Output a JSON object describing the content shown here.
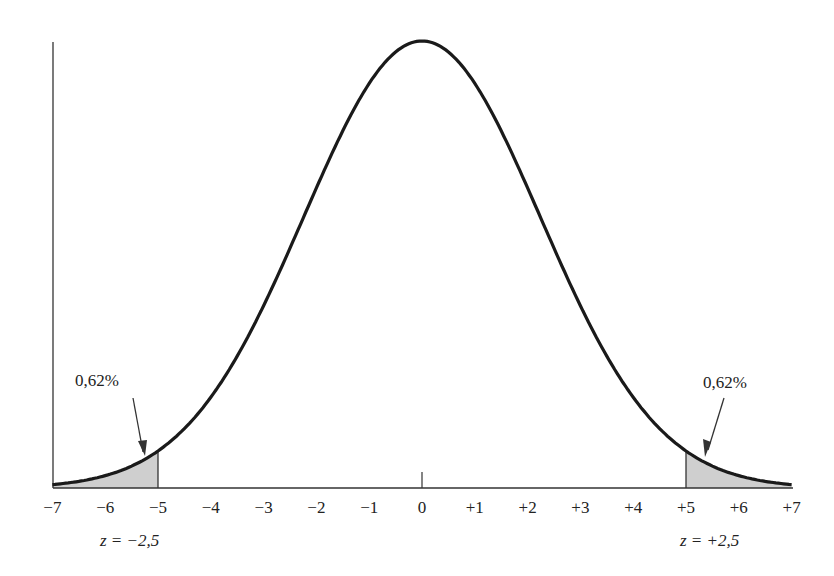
{
  "chart_data": {
    "type": "area",
    "title": "",
    "xlabel": "",
    "ylabel": "",
    "x_ticks": [
      "−7",
      "−6",
      "−5",
      "−4",
      "−3",
      "−2",
      "−1",
      "0",
      "+1",
      "+2",
      "+3",
      "+4",
      "+5",
      "+6",
      "+7"
    ],
    "x_values": [
      -7,
      -6,
      -5,
      -4,
      -3,
      -2,
      -1,
      0,
      1,
      2,
      3,
      4,
      5,
      6,
      7
    ],
    "xlim": [
      -7,
      7
    ],
    "grid": false,
    "legend": null,
    "curve": "normal distribution (bell curve) centered at 0",
    "shaded_regions": [
      {
        "from": -7,
        "to": -5,
        "label": "0,62%",
        "z_label": "z = −2,5"
      },
      {
        "from": 5,
        "to": 7,
        "label": "0,62%",
        "z_label": "z = +2,5"
      }
    ],
    "annotations": [
      "0,62%",
      "0,62%",
      "z = −2,5",
      "z = +2,5"
    ],
    "colors": {
      "curve": "#1a1a1a",
      "shade": "#cfcfcf",
      "axis": "#333333"
    }
  },
  "labels": {
    "left_pct": "0,62%",
    "right_pct": "0,62%",
    "left_z": "z = −2,5",
    "right_z": "z = +2,5"
  }
}
